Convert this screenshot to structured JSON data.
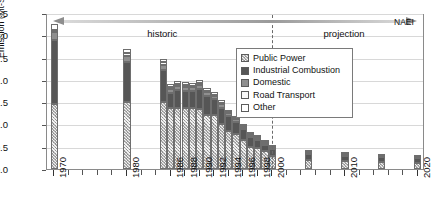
{
  "chart_data": {
    "type": "bar",
    "title": "",
    "xlabel": "",
    "ylabel": "Emission (Mt-S)",
    "ylim": [
      0.0,
      3.5
    ],
    "xlim": [
      1969,
      2021
    ],
    "grid": true,
    "legend_position": "right-top",
    "ytick_labels": [
      "0.0",
      "0.5",
      "1.0",
      "1.5",
      "2.0",
      "2.5",
      "3.0",
      "3.5"
    ],
    "ytick_values": [
      0.0,
      0.5,
      1.0,
      1.5,
      2.0,
      2.5,
      3.0,
      3.5
    ],
    "xtick_labels": [
      "1970",
      "1980",
      "1986",
      "1988",
      "1990",
      "1992",
      "1994",
      "1996",
      "1998",
      "2000",
      "2010",
      "2020"
    ],
    "xtick_values": [
      1970,
      1980,
      1986,
      1988,
      1990,
      1992,
      1994,
      1996,
      1998,
      2000,
      2010,
      2020
    ],
    "categories": [
      1970,
      1980,
      1985,
      1986,
      1987,
      1988,
      1989,
      1990,
      1991,
      1992,
      1993,
      1994,
      1995,
      1996,
      1997,
      1998,
      1999,
      2000,
      2005,
      2010,
      2015,
      2020
    ],
    "series": [
      {
        "name": "Public Power",
        "values": [
          1.45,
          1.5,
          1.5,
          1.38,
          1.38,
          1.38,
          1.38,
          1.35,
          1.22,
          1.22,
          1.02,
          0.85,
          0.78,
          0.65,
          0.5,
          0.48,
          0.4,
          0.3,
          0.2,
          0.18,
          0.15,
          0.14
        ]
      },
      {
        "name": "Industrial Combustion",
        "values": [
          1.45,
          0.9,
          0.72,
          0.32,
          0.4,
          0.38,
          0.36,
          0.45,
          0.42,
          0.35,
          0.36,
          0.34,
          0.28,
          0.25,
          0.22,
          0.18,
          0.14,
          0.14,
          0.14,
          0.12,
          0.11,
          0.1
        ]
      },
      {
        "name": "Domestic",
        "values": [
          0.17,
          0.14,
          0.12,
          0.09,
          0.09,
          0.09,
          0.09,
          0.08,
          0.08,
          0.07,
          0.07,
          0.06,
          0.06,
          0.05,
          0.05,
          0.04,
          0.04,
          0.04,
          0.03,
          0.03,
          0.02,
          0.02
        ]
      },
      {
        "name": "Road Transport",
        "values": [
          0.06,
          0.06,
          0.05,
          0.04,
          0.04,
          0.04,
          0.04,
          0.04,
          0.04,
          0.03,
          0.03,
          0.03,
          0.03,
          0.02,
          0.02,
          0.02,
          0.02,
          0.02,
          0.01,
          0.01,
          0.01,
          0.01
        ]
      },
      {
        "name": "Other",
        "values": [
          0.12,
          0.1,
          0.08,
          0.07,
          0.07,
          0.07,
          0.07,
          0.07,
          0.06,
          0.06,
          0.06,
          0.05,
          0.05,
          0.04,
          0.04,
          0.03,
          0.03,
          0.03,
          0.02,
          0.02,
          0.02,
          0.02
        ]
      }
    ],
    "annotations": [
      {
        "name": "historic",
        "label": "historic",
        "from": 1970,
        "to": 2000,
        "direction": "left"
      },
      {
        "name": "projection",
        "label": "projection",
        "from": 2000,
        "to": 2020,
        "direction": "right"
      },
      {
        "name": "divider",
        "label": "",
        "at": 2000
      },
      {
        "name": "source",
        "label": "NAEI"
      }
    ]
  },
  "legend": {
    "items": [
      {
        "label": "Public Power",
        "swatch": "s0"
      },
      {
        "label": "Industrial Combustion",
        "swatch": "s1"
      },
      {
        "label": "Domestic",
        "swatch": "s2"
      },
      {
        "label": "Road Transport",
        "swatch": "s3"
      },
      {
        "label": "Other",
        "swatch": "s4"
      }
    ]
  },
  "colors": {
    "public_power": "#b3b3b3",
    "industrial_combustion": "#565656",
    "domestic": "#8f8f8f",
    "road_transport": "#fafafa",
    "other": "#ffffff",
    "grid": "#d8d8d8",
    "frame": "#8a8a8a",
    "arrow": "#8e8e8e"
  }
}
